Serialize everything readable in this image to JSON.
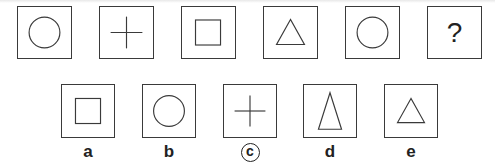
{
  "sequence": {
    "items": [
      {
        "shape": "circle"
      },
      {
        "shape": "cross"
      },
      {
        "shape": "square"
      },
      {
        "shape": "triangle"
      },
      {
        "shape": "circle"
      },
      {
        "shape": "question",
        "text": "?"
      }
    ]
  },
  "options": {
    "items": [
      {
        "label": "a",
        "shape": "square"
      },
      {
        "label": "b",
        "shape": "circle"
      },
      {
        "label": "c",
        "shape": "cross",
        "selected": true
      },
      {
        "label": "d",
        "shape": "tall-triangle"
      },
      {
        "label": "e",
        "shape": "triangle"
      }
    ]
  },
  "colors": {
    "stroke": "#3a3a3a",
    "background": "#ffffff"
  }
}
